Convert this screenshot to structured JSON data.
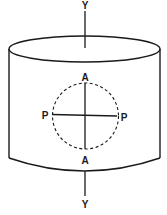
{
  "diagram": {
    "type": "cylinder-with-axis",
    "colors": {
      "stroke": "#1a1a1a",
      "background": "#ffffff"
    },
    "labels": {
      "axis_top": "Y",
      "axis_bottom": "Y",
      "circle_top": "A",
      "circle_bottom": "A",
      "circle_left": "P",
      "circle_right": "P"
    }
  }
}
